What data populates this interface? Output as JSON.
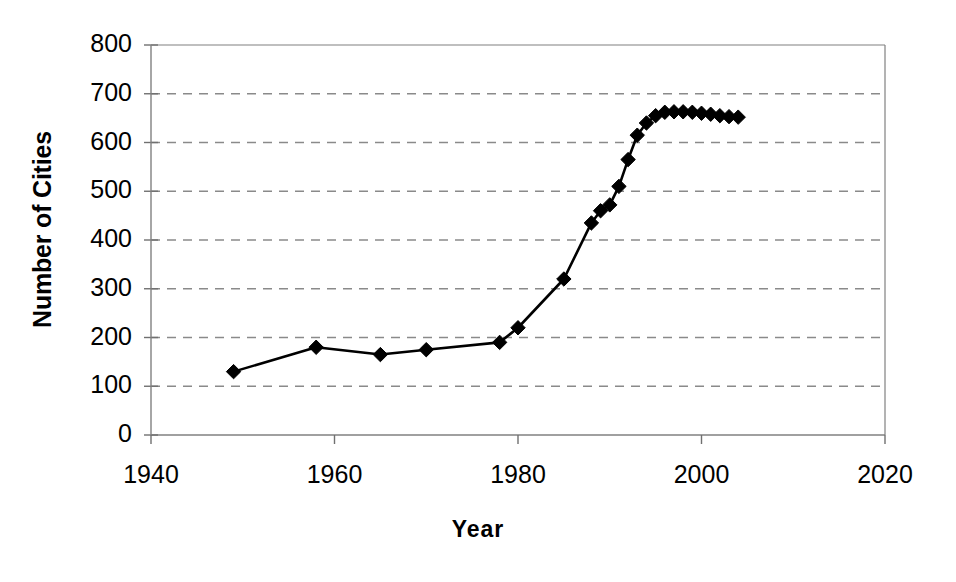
{
  "chart_data": {
    "type": "line",
    "title": "",
    "xlabel": "Year",
    "ylabel": "Number of Cities",
    "xlim": [
      1940,
      2020
    ],
    "ylim": [
      0,
      800
    ],
    "xticks": [
      "1940",
      "1960",
      "1980",
      "2000",
      "2020"
    ],
    "yticks": [
      "0",
      "100",
      "200",
      "300",
      "400",
      "500",
      "600",
      "700",
      "800"
    ],
    "grid": "horizontal-dashed",
    "legend": "none",
    "marker": "filled-diamond",
    "line_color": "#000000",
    "marker_color": "#000000",
    "grid_color": "#808080",
    "axis_color": "#808080",
    "series": [
      {
        "name": "Number of Cities",
        "x": [
          1949,
          1958,
          1965,
          1970,
          1978,
          1980,
          1985,
          1988,
          1989,
          1990,
          1991,
          1992,
          1993,
          1994,
          1995,
          1996,
          1997,
          1998,
          1999,
          2000,
          2001,
          2002,
          2003,
          2004
        ],
        "values": [
          130,
          180,
          165,
          175,
          190,
          220,
          320,
          435,
          460,
          472,
          510,
          565,
          615,
          640,
          655,
          662,
          663,
          663,
          662,
          660,
          658,
          655,
          653,
          652
        ]
      }
    ]
  },
  "axis": {
    "y_title": "Number of Cities",
    "x_title": "Year",
    "y_ticks": [
      {
        "value": 800,
        "label": "800"
      },
      {
        "value": 700,
        "label": "700"
      },
      {
        "value": 600,
        "label": "600"
      },
      {
        "value": 500,
        "label": "500"
      },
      {
        "value": 400,
        "label": "400"
      },
      {
        "value": 300,
        "label": "300"
      },
      {
        "value": 200,
        "label": "200"
      },
      {
        "value": 100,
        "label": "100"
      },
      {
        "value": 0,
        "label": "0"
      }
    ],
    "x_ticks": [
      {
        "value": 1940,
        "label": "1940"
      },
      {
        "value": 1960,
        "label": "1960"
      },
      {
        "value": 1980,
        "label": "1980"
      },
      {
        "value": 2000,
        "label": "2000"
      },
      {
        "value": 2020,
        "label": "2020"
      }
    ]
  }
}
